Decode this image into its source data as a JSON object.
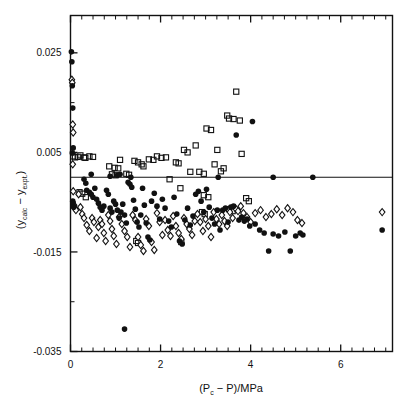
{
  "chart_data": {
    "type": "scatter",
    "title": "",
    "subtitle": "",
    "xlabel": "(Pc - P)/MPa",
    "xlabel_parts": {
      "open": "(P",
      "sub": "c",
      "mid": "  -  P)/MPa"
    },
    "ylabel": "(ycalc - yexpt.)",
    "ylabel_parts": {
      "open": "(y",
      "sub1": "calc",
      "mid": "  -  y",
      "sub2": "expt.",
      "close": ")"
    },
    "xlim": [
      0,
      7.15
    ],
    "ylim": [
      -0.035,
      0.0325
    ],
    "xticks": [
      0,
      2,
      4,
      6
    ],
    "xticklabels": [
      "0",
      "2",
      "4",
      "6"
    ],
    "x_minor_step": 0.25,
    "yticks": [
      0.025,
      0.005,
      -0.015,
      -0.035
    ],
    "yticklabels": [
      "0.025",
      "0.005",
      "-0.015",
      "-0.035"
    ],
    "y_minor_ticks": [
      0.015,
      -0.005,
      -0.025
    ],
    "grid": false,
    "legend": "none",
    "reference_line": {
      "y": 0.0,
      "label": "zero-residual-line",
      "color": "#111111"
    },
    "annotations": [],
    "series": [
      {
        "name": "open-squares",
        "marker": "square-open",
        "color": "#111111",
        "points": [
          [
            0.06,
            0.0042
          ],
          [
            0.1,
            0.004
          ],
          [
            0.16,
            0.0041
          ],
          [
            0.22,
            0.0044
          ],
          [
            0.3,
            0.004
          ],
          [
            0.33,
            0.0039
          ],
          [
            0.42,
            0.0042
          ],
          [
            0.5,
            0.0041
          ],
          [
            0.2,
            -0.003
          ],
          [
            0.26,
            -0.0033
          ],
          [
            0.34,
            -0.004
          ],
          [
            0.86,
            0.0022
          ],
          [
            0.92,
            0.0006
          ],
          [
            1.0,
            0.0004
          ],
          [
            1.1,
            0.0035
          ],
          [
            1.24,
            0.0007
          ],
          [
            1.3,
            0.0005
          ],
          [
            1.42,
            0.0033
          ],
          [
            1.5,
            0.003
          ],
          [
            1.58,
            0.0026
          ],
          [
            1.62,
            0.0022
          ],
          [
            1.74,
            0.0036
          ],
          [
            1.84,
            0.0035
          ],
          [
            1.92,
            0.0042
          ],
          [
            2.02,
            0.0039
          ],
          [
            2.12,
            0.004
          ],
          [
            2.2,
            -0.0004
          ],
          [
            2.34,
            0.003
          ],
          [
            2.4,
            0.0028
          ],
          [
            2.44,
            -0.0022
          ],
          [
            2.52,
            0.0055
          ],
          [
            2.6,
            0.005
          ],
          [
            2.66,
            0.0011
          ],
          [
            2.78,
            0.0064
          ],
          [
            2.86,
            0.0011
          ],
          [
            2.96,
            0.0007
          ],
          [
            3.02,
            0.0098
          ],
          [
            3.12,
            0.0095
          ],
          [
            3.2,
            0.0026
          ],
          [
            3.26,
            0.0055
          ],
          [
            3.34,
            0.0012
          ],
          [
            3.4,
            0.0018
          ],
          [
            3.48,
            0.0124
          ],
          [
            3.52,
            0.0118
          ],
          [
            3.62,
            0.0117
          ],
          [
            3.68,
            0.0172
          ],
          [
            3.76,
            0.0114
          ],
          [
            3.8,
            0.0047
          ],
          [
            3.9,
            -0.0042
          ],
          [
            3.96,
            -0.0048
          ],
          [
            1.46,
            -0.0128
          ],
          [
            1.5,
            -0.0132
          ],
          [
            2.46,
            -0.013
          ],
          [
            2.92,
            -0.007
          ],
          [
            2.98,
            -0.0074
          ],
          [
            3.52,
            -0.0064
          ],
          [
            3.6,
            -0.0068
          ],
          [
            0.98,
            0.0019
          ],
          [
            1.06,
            0.0018
          ],
          [
            2.96,
            -0.0036
          ],
          [
            3.06,
            -0.004
          ]
        ]
      },
      {
        "name": "filled-circles",
        "marker": "circle-filled",
        "color": "#111111",
        "points": [
          [
            0.02,
            0.0252
          ],
          [
            0.03,
            0.0232
          ],
          [
            0.04,
            0.0184
          ],
          [
            0.05,
            0.0139
          ],
          [
            0.06,
            0.0059
          ],
          [
            0.04,
            0.0049
          ],
          [
            0.05,
            -0.0048
          ],
          [
            0.06,
            -0.0052
          ],
          [
            0.07,
            -0.006
          ],
          [
            0.3,
            -0.0004
          ],
          [
            0.34,
            -0.0012
          ],
          [
            0.36,
            -0.0026
          ],
          [
            0.42,
            -0.003
          ],
          [
            0.46,
            -0.0034
          ],
          [
            0.5,
            -0.004
          ],
          [
            0.54,
            -0.0022
          ],
          [
            0.58,
            -0.0044
          ],
          [
            0.62,
            -0.0052
          ],
          [
            0.66,
            -0.006
          ],
          [
            0.7,
            -0.0066
          ],
          [
            0.74,
            -0.0058
          ],
          [
            0.8,
            -0.0026
          ],
          [
            0.84,
            -0.0034
          ],
          [
            0.88,
            -0.0062
          ],
          [
            0.92,
            -0.007
          ],
          [
            0.96,
            -0.0048
          ],
          [
            1.0,
            -0.0054
          ],
          [
            1.04,
            -0.0066
          ],
          [
            1.08,
            -0.0082
          ],
          [
            1.12,
            -0.007
          ],
          [
            1.16,
            -0.0054
          ],
          [
            1.2,
            -0.0076
          ],
          [
            1.24,
            -0.0092
          ],
          [
            1.2,
            -0.0305
          ],
          [
            1.28,
            -0.001
          ],
          [
            1.32,
            -0.0014
          ],
          [
            1.36,
            -0.002
          ],
          [
            1.4,
            -0.0046
          ],
          [
            1.44,
            -0.0064
          ],
          [
            1.48,
            -0.009
          ],
          [
            1.52,
            -0.01
          ],
          [
            1.56,
            -0.0076
          ],
          [
            1.6,
            -0.0022
          ],
          [
            1.64,
            -0.0056
          ],
          [
            1.68,
            -0.0092
          ],
          [
            1.72,
            -0.012
          ],
          [
            1.76,
            -0.0126
          ],
          [
            1.8,
            -0.0048
          ],
          [
            1.86,
            -0.0032
          ],
          [
            1.92,
            -0.0058
          ],
          [
            1.98,
            -0.0084
          ],
          [
            2.04,
            -0.0044
          ],
          [
            2.1,
            -0.0062
          ],
          [
            2.18,
            -0.0088
          ],
          [
            2.24,
            -0.01
          ],
          [
            2.3,
            -0.004
          ],
          [
            2.36,
            -0.0074
          ],
          [
            2.42,
            -0.0128
          ],
          [
            2.48,
            -0.0134
          ],
          [
            2.54,
            -0.0086
          ],
          [
            2.6,
            -0.0062
          ],
          [
            2.66,
            -0.0096
          ],
          [
            2.72,
            -0.0078
          ],
          [
            2.78,
            -0.0034
          ],
          [
            2.84,
            -0.0028
          ],
          [
            2.9,
            -0.0048
          ],
          [
            2.96,
            -0.007
          ],
          [
            3.02,
            -0.0024
          ],
          [
            3.08,
            -0.006
          ],
          [
            3.14,
            -0.0082
          ],
          [
            3.2,
            -0.0094
          ],
          [
            3.26,
            -0.0066
          ],
          [
            3.32,
            -0.0106
          ],
          [
            3.38,
            -0.0066
          ],
          [
            3.44,
            -0.0062
          ],
          [
            3.5,
            -0.009
          ],
          [
            3.56,
            -0.006
          ],
          [
            3.62,
            -0.0058
          ],
          [
            3.68,
            0.0085
          ],
          [
            3.74,
            -0.0086
          ],
          [
            3.8,
            -0.008
          ],
          [
            3.86,
            -0.0088
          ],
          [
            3.92,
            -0.0084
          ],
          [
            3.98,
            -0.0098
          ],
          [
            4.04,
            0.0112
          ],
          [
            4.1,
            -0.0094
          ],
          [
            4.2,
            -0.0106
          ],
          [
            4.3,
            -0.0112
          ],
          [
            4.4,
            -0.0148
          ],
          [
            4.5,
            -0.0114
          ],
          [
            4.62,
            -0.0118
          ],
          [
            4.76,
            -0.011
          ],
          [
            4.88,
            -0.0148
          ],
          [
            5.0,
            -0.0118
          ],
          [
            5.1,
            -0.0112
          ],
          [
            5.16,
            -0.0116
          ],
          [
            6.92,
            -0.0106
          ],
          [
            1.34,
            0.0
          ],
          [
            3.28,
            0.0
          ],
          [
            4.5,
            0.0
          ],
          [
            5.38,
            0.0
          ],
          [
            0.46,
            0.0006
          ],
          [
            0.88,
            0.0002
          ],
          [
            1.04,
            0.0004
          ],
          [
            1.1,
            0.0006
          ]
        ]
      },
      {
        "name": "open-diamonds",
        "marker": "diamond-open",
        "color": "#111111",
        "points": [
          [
            0.03,
            0.0196
          ],
          [
            0.04,
            0.019
          ],
          [
            0.05,
            0.0106
          ],
          [
            0.06,
            0.009
          ],
          [
            0.05,
            0.0026
          ],
          [
            0.06,
            -0.0028
          ],
          [
            0.08,
            -0.0056
          ],
          [
            0.1,
            -0.0062
          ],
          [
            0.12,
            -0.0066
          ],
          [
            0.18,
            -0.0034
          ],
          [
            0.22,
            -0.006
          ],
          [
            0.26,
            -0.0074
          ],
          [
            0.3,
            -0.0082
          ],
          [
            0.36,
            -0.0096
          ],
          [
            0.42,
            -0.0108
          ],
          [
            0.48,
            -0.0082
          ],
          [
            0.52,
            -0.009
          ],
          [
            0.58,
            -0.0122
          ],
          [
            0.62,
            -0.01
          ],
          [
            0.66,
            -0.0086
          ],
          [
            0.7,
            -0.0094
          ],
          [
            0.74,
            -0.0112
          ],
          [
            0.78,
            -0.0128
          ],
          [
            0.84,
            -0.0076
          ],
          [
            0.88,
            -0.0088
          ],
          [
            0.92,
            -0.0104
          ],
          [
            0.96,
            -0.0118
          ],
          [
            1.02,
            -0.0134
          ],
          [
            1.08,
            -0.008
          ],
          [
            1.14,
            -0.0094
          ],
          [
            1.2,
            -0.0108
          ],
          [
            1.26,
            -0.012
          ],
          [
            1.32,
            -0.014
          ],
          [
            1.38,
            -0.0076
          ],
          [
            1.44,
            -0.0086
          ],
          [
            1.5,
            -0.012
          ],
          [
            1.56,
            -0.0136
          ],
          [
            1.62,
            -0.0148
          ],
          [
            1.68,
            -0.0084
          ],
          [
            1.74,
            -0.0098
          ],
          [
            1.8,
            -0.013
          ],
          [
            1.86,
            -0.0146
          ],
          [
            1.92,
            -0.0072
          ],
          [
            1.98,
            -0.009
          ],
          [
            2.04,
            -0.0116
          ],
          [
            2.1,
            -0.0086
          ],
          [
            2.16,
            -0.0106
          ],
          [
            2.22,
            -0.0118
          ],
          [
            2.28,
            -0.0078
          ],
          [
            2.34,
            -0.0098
          ],
          [
            2.4,
            -0.0112
          ],
          [
            2.46,
            -0.0124
          ],
          [
            2.52,
            -0.0082
          ],
          [
            2.58,
            -0.0094
          ],
          [
            2.64,
            -0.0104
          ],
          [
            2.7,
            -0.0116
          ],
          [
            2.76,
            -0.0088
          ],
          [
            2.82,
            -0.0074
          ],
          [
            2.88,
            -0.009
          ],
          [
            2.94,
            -0.0108
          ],
          [
            3.0,
            -0.0084
          ],
          [
            3.06,
            -0.0098
          ],
          [
            3.12,
            -0.012
          ],
          [
            3.18,
            -0.007
          ],
          [
            3.24,
            -0.0084
          ],
          [
            3.3,
            -0.0094
          ],
          [
            3.36,
            -0.0076
          ],
          [
            3.42,
            -0.0088
          ],
          [
            3.48,
            -0.0098
          ],
          [
            3.54,
            -0.007
          ],
          [
            3.6,
            -0.0082
          ],
          [
            3.66,
            -0.0062
          ],
          [
            3.72,
            -0.0068
          ],
          [
            3.78,
            -0.0058
          ],
          [
            3.84,
            -0.0072
          ],
          [
            3.92,
            -0.008
          ],
          [
            4.0,
            -0.009
          ],
          [
            4.1,
            -0.0072
          ],
          [
            4.22,
            -0.0066
          ],
          [
            4.34,
            -0.008
          ],
          [
            4.46,
            -0.0074
          ],
          [
            4.58,
            -0.0064
          ],
          [
            4.7,
            -0.0076
          ],
          [
            4.82,
            -0.0062
          ],
          [
            4.94,
            -0.007
          ],
          [
            5.04,
            -0.0086
          ],
          [
            5.14,
            -0.0092
          ],
          [
            6.92,
            -0.007
          ]
        ]
      }
    ]
  },
  "axis": {
    "y_title_open": "(y",
    "y_title_sub1": "calc",
    "y_title_mid": "  −  y",
    "y_title_sub2": "expt.",
    "y_title_close": ")",
    "x_title_open": "(P",
    "x_title_sub": "c",
    "x_title_rest": "  −  P)/MPa"
  }
}
